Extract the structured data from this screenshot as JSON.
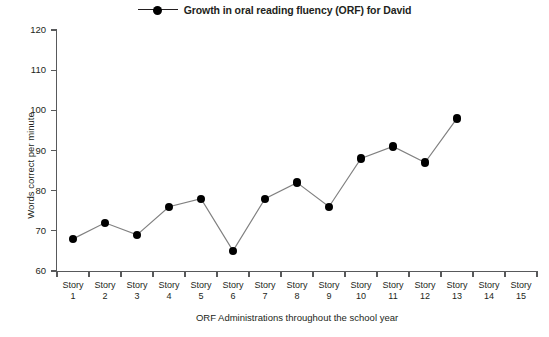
{
  "chart_data": {
    "type": "line",
    "title": "",
    "legend": [
      {
        "label": "Growth in oral reading fluency (ORF) for David",
        "marker": "filled-circle",
        "color": "#000000"
      }
    ],
    "legend_position": "top-center",
    "categories": [
      "Story 1",
      "Story 2",
      "Story 3",
      "Story 4",
      "Story 5",
      "Story 6",
      "Story 7",
      "Story 8",
      "Story 9",
      "Story 10",
      "Story 11",
      "Story 12",
      "Story 13",
      "Story 14",
      "Story 15"
    ],
    "category_lines": [
      {
        "top": "Story",
        "bottom": "1"
      },
      {
        "top": "Story",
        "bottom": "2"
      },
      {
        "top": "Story",
        "bottom": "3"
      },
      {
        "top": "Story",
        "bottom": "4"
      },
      {
        "top": "Story",
        "bottom": "5"
      },
      {
        "top": "Story",
        "bottom": "6"
      },
      {
        "top": "Story",
        "bottom": "7"
      },
      {
        "top": "Story",
        "bottom": "8"
      },
      {
        "top": "Story",
        "bottom": "9"
      },
      {
        "top": "Story",
        "bottom": "10"
      },
      {
        "top": "Story",
        "bottom": "11"
      },
      {
        "top": "Story",
        "bottom": "12"
      },
      {
        "top": "Story",
        "bottom": "13"
      },
      {
        "top": "Story",
        "bottom": "14"
      },
      {
        "top": "Story",
        "bottom": "15"
      }
    ],
    "series": [
      {
        "name": "Growth in oral reading fluency (ORF) for David",
        "values": [
          68,
          72,
          69,
          76,
          78,
          65,
          78,
          82,
          76,
          88,
          91,
          87,
          98,
          null,
          null
        ]
      }
    ],
    "xlabel": "ORF Administrations throughout the school year",
    "ylabel": "Words correct per minute",
    "ylim": [
      60,
      120
    ],
    "yticks": [
      60,
      70,
      80,
      90,
      100,
      110,
      120
    ],
    "ytick_labels": [
      "60",
      "70",
      "80",
      "90",
      "100",
      "110",
      "120"
    ],
    "grid": false,
    "line_color": "#808080",
    "marker_color": "#000000",
    "axis_color": "#58595b",
    "background": "#ffffff"
  }
}
